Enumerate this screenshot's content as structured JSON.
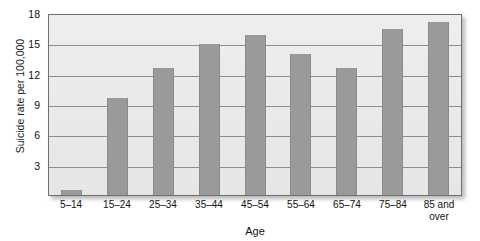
{
  "chart_data": {
    "type": "bar",
    "title": "",
    "xlabel": "Age",
    "ylabel": "Suicide rate per 100,000",
    "categories": [
      "5–14",
      "15–24",
      "25–34",
      "35–44",
      "45–54",
      "55–64",
      "65–74",
      "75–84",
      "85 and over"
    ],
    "values": [
      0.5,
      9.6,
      12.6,
      14.9,
      15.8,
      13.9,
      12.6,
      16.4,
      17.1
    ],
    "ylim": [
      0,
      18
    ],
    "yticks": [
      3,
      6,
      9,
      12,
      15,
      18
    ],
    "ytick_labels": [
      "3",
      "6",
      "9",
      "12",
      "15",
      "18"
    ],
    "grid": true,
    "legend": "none",
    "bar_color": "#9a9a9a",
    "plot_background": "#ebebeb",
    "axis_color": "#6f6f6f",
    "gridline_color": "#8d8d8d"
  },
  "axis": {
    "y_title": "Suicide rate per 100,000",
    "x_title": "Age"
  },
  "xtick_lines": [
    [
      "5–14",
      ""
    ],
    [
      "15–24",
      ""
    ],
    [
      "25–34",
      ""
    ],
    [
      "35–44",
      ""
    ],
    [
      "45–54",
      ""
    ],
    [
      "55–64",
      ""
    ],
    [
      "65–74",
      ""
    ],
    [
      "75–84",
      ""
    ],
    [
      "85 and",
      "over"
    ]
  ]
}
